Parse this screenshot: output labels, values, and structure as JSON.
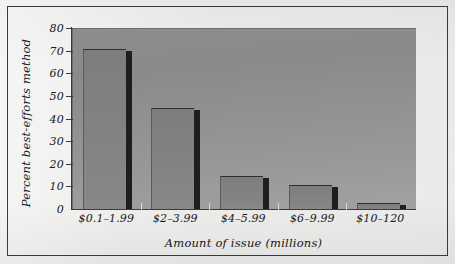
{
  "chart_data": {
    "type": "bar",
    "title": "",
    "subtitle": "",
    "xlabel": "Amount of issue (millions)",
    "ylabel": "Percent best-efforts method",
    "categories": [
      "$0.1–1.99",
      "$2–3.99",
      "$4–5.99",
      "$6–9.99",
      "$10–120"
    ],
    "values": [
      71,
      45,
      15,
      11,
      3
    ],
    "series": [
      {
        "name": "Percent best-efforts method",
        "values": [
          71,
          45,
          15,
          11,
          3
        ]
      }
    ],
    "ylim": [
      0,
      80
    ],
    "ytick_labels": [
      "80",
      "70",
      "60",
      "50",
      "40",
      "30",
      "20",
      "10",
      "0"
    ],
    "ytick_values": [
      80,
      70,
      60,
      50,
      40,
      30,
      20,
      10,
      0
    ],
    "ytick_step": 10,
    "grid": false,
    "legend": null,
    "legend_position": "none",
    "annotations": [],
    "bar_color": "#848484",
    "bar_shadow_color": "#1e1e1e",
    "plot_background_color": "#939393",
    "page_background_color": "#e8e8e6",
    "frame_color": "#3a3a3a",
    "text_color": "#16161a"
  }
}
